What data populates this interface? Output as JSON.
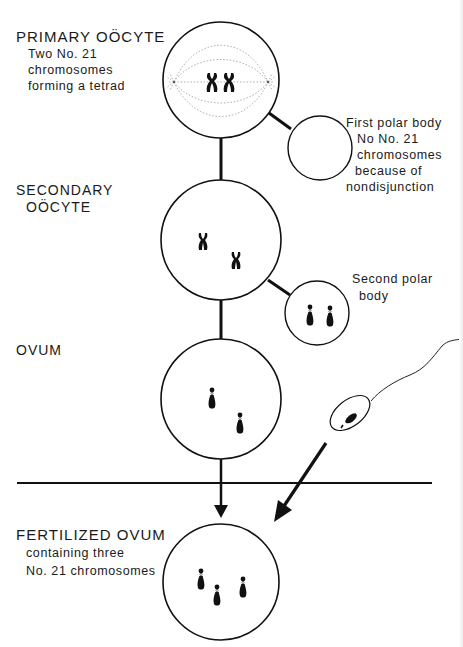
{
  "stages": {
    "primary_oocyte": {
      "title": "PRIMARY OÖCYTE",
      "description": [
        "Two No. 21",
        "chromosomes",
        "forming a tetrad"
      ]
    },
    "first_polar_body": {
      "description": [
        "First polar body",
        "No No. 21",
        "chromosomes",
        "because of",
        "nondisjunction"
      ]
    },
    "secondary_oocyte": {
      "title_lines": [
        "SECONDARY",
        "OÖCYTE"
      ]
    },
    "second_polar_body": {
      "description": [
        "Second polar",
        "body"
      ]
    },
    "ovum": {
      "title": "OVUM"
    },
    "fertilized_ovum": {
      "title": "FERTILIZED OVUM",
      "description": [
        "containing three",
        "No. 21 chromosomes"
      ]
    }
  },
  "colors": {
    "ink": "#111111",
    "spindle": "#9a9a9a",
    "background": "#ffffff"
  }
}
